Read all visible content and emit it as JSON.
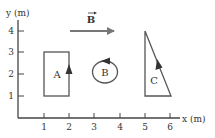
{
  "diagram": {
    "x_axis_label": "x (m)",
    "y_axis_label": "y (m)",
    "x_ticks": [
      "1",
      "2",
      "3",
      "4",
      "5",
      "6"
    ],
    "y_ticks": [
      "1",
      "2",
      "3",
      "4"
    ],
    "field_label": "B",
    "field_direction": "+x",
    "loops": [
      {
        "label": "A",
        "shape": "rectangle",
        "x_range": [
          1,
          2
        ],
        "y_range": [
          1,
          3
        ],
        "current_direction": "counterclockwise (up on right side)"
      },
      {
        "label": "B",
        "shape": "circle",
        "center": [
          3,
          2
        ],
        "current_direction": "counterclockwise"
      },
      {
        "label": "C",
        "shape": "right-triangle",
        "vertices": [
          [
            5,
            4
          ],
          [
            5,
            1
          ],
          [
            6,
            1
          ]
        ],
        "current_direction": "counterclockwise (up-left along hypotenuse)"
      }
    ],
    "colors": {
      "axis": "#444444",
      "loop": "#555555",
      "field_arrow": "#777777",
      "text": "#333333"
    }
  }
}
